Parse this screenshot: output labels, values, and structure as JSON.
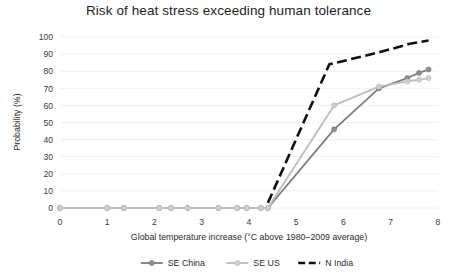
{
  "chart_data": {
    "type": "line",
    "title": "Risk of heat stress exceeding human tolerance",
    "xlabel": "Global temperature increase (°C above 1980–2009 average)",
    "ylabel": "Probability (%)",
    "xlim": [
      0,
      8
    ],
    "ylim": [
      0,
      100
    ],
    "xticks": [
      "0",
      "1",
      "2",
      "3",
      "4",
      "5",
      "6",
      "7",
      "8"
    ],
    "yticks": [
      "0",
      "10",
      "20",
      "30",
      "40",
      "50",
      "60",
      "70",
      "80",
      "90",
      "100"
    ],
    "grid": "horizontal",
    "legend_position": "bottom",
    "series": [
      {
        "name": "SE China",
        "color": "#7d7d7d",
        "style": "solid",
        "marker": "circle",
        "x": [
          0.0,
          1.0,
          1.35,
          2.1,
          2.35,
          2.7,
          3.35,
          3.75,
          3.95,
          4.25,
          4.4,
          5.8,
          6.75,
          7.35,
          7.6,
          7.8
        ],
        "y": [
          0,
          0,
          0,
          0,
          0,
          0,
          0,
          0,
          0,
          0,
          0,
          46,
          70,
          76,
          79,
          81
        ]
      },
      {
        "name": "SE US",
        "color": "#bdbdbd",
        "style": "solid",
        "marker": "circle",
        "x": [
          0.0,
          1.0,
          1.35,
          2.1,
          2.35,
          2.7,
          3.35,
          3.75,
          3.95,
          4.25,
          4.4,
          5.8,
          6.75,
          7.35,
          7.6,
          7.8
        ],
        "y": [
          0,
          0,
          0,
          0,
          0,
          0,
          0,
          0,
          0,
          0,
          0,
          60,
          71,
          74,
          75,
          76
        ]
      },
      {
        "name": "N India",
        "color": "#111111",
        "style": "dashed",
        "marker": "none",
        "x": [
          4.4,
          5.7,
          6.75,
          7.4,
          7.8
        ],
        "y": [
          3,
          84,
          91,
          96,
          98
        ]
      }
    ]
  },
  "legend": {
    "items": [
      {
        "label": "SE China",
        "color": "#7d7d7d",
        "style": "solid",
        "marker": "circle"
      },
      {
        "label": "SE US",
        "color": "#bdbdbd",
        "style": "solid",
        "marker": "circle"
      },
      {
        "label": "N India",
        "color": "#111111",
        "style": "dashed",
        "marker": "none"
      }
    ]
  }
}
